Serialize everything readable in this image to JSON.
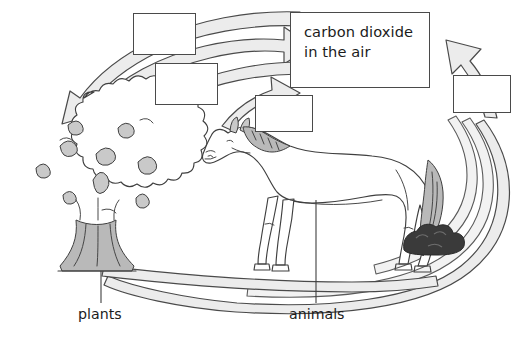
{
  "diagram": {
    "background_color": "#ffffff",
    "ink_color": "#3f3f3f",
    "band_fill": "#ececec",
    "shade_fill": "#b8b8b8",
    "dung_fill": "#3a3a3a"
  },
  "co2_box": {
    "line1": "carbon dioxide",
    "line2": "in the air"
  },
  "answer_boxes": [
    {
      "id": "box-1",
      "value": ""
    },
    {
      "id": "box-2",
      "value": ""
    },
    {
      "id": "box-3",
      "value": ""
    },
    {
      "id": "box-4",
      "value": ""
    }
  ],
  "labels": {
    "plants": "plants",
    "animals": "animals"
  },
  "organisms": [
    {
      "name": "tree",
      "label": "plants"
    },
    {
      "name": "horse",
      "label": "animals"
    },
    {
      "name": "dung-pile",
      "label": ""
    }
  ]
}
